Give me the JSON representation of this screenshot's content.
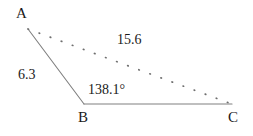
{
  "figure": {
    "type": "triangle-diagram",
    "background_color": "#ffffff",
    "stroke_color": "#808080",
    "text_color": "#1a1a1a",
    "vertices": {
      "a": {
        "label": "A",
        "x": 28,
        "y": 29
      },
      "b": {
        "label": "B",
        "x": 84,
        "y": 104
      },
      "c": {
        "label": "C",
        "x": 232,
        "y": 104
      }
    },
    "sides": {
      "ab": {
        "label": "6.3",
        "style": "solid",
        "value": 6.3
      },
      "bc": {
        "label": "",
        "style": "solid"
      },
      "ac": {
        "label": "15.6",
        "style": "dotted",
        "value": 15.6
      }
    },
    "angles": {
      "b": {
        "label": "138.1°",
        "value": 138.1,
        "unit": "degrees"
      }
    }
  },
  "chart_data": {
    "type": "diagram",
    "title": "",
    "subtitle": "",
    "xlabel": "",
    "ylabel": "",
    "points": [
      {
        "name": "A",
        "x": 28,
        "y": 29
      },
      {
        "name": "B",
        "x": 84,
        "y": 104
      },
      {
        "name": "C",
        "x": 232,
        "y": 104
      }
    ],
    "segments": [
      {
        "from": "A",
        "to": "B",
        "style": "solid",
        "length_label": "6.3"
      },
      {
        "from": "B",
        "to": "C",
        "style": "solid",
        "length_label": ""
      },
      {
        "from": "A",
        "to": "C",
        "style": "dotted",
        "length_label": "15.6"
      }
    ],
    "annotations": [
      {
        "text": "6.3",
        "kind": "side-length",
        "attached_to": "AB"
      },
      {
        "text": "15.6",
        "kind": "side-length",
        "attached_to": "AC"
      },
      {
        "text": "138.1°",
        "kind": "angle",
        "attached_to": "B"
      },
      {
        "text": "A",
        "kind": "vertex-label"
      },
      {
        "text": "B",
        "kind": "vertex-label"
      },
      {
        "text": "C",
        "kind": "vertex-label"
      }
    ],
    "grid": false,
    "legend": "none"
  }
}
